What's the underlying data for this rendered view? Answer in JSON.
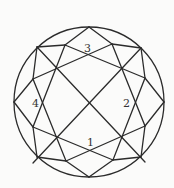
{
  "diagram": {
    "stroke_color": "#2b2b2b",
    "background_color": "#fbfbfa",
    "circle": {
      "cx": 89,
      "cy": 102,
      "r": 75
    },
    "labels": [
      {
        "text": "3",
        "x": 84,
        "y": 52
      },
      {
        "text": "2",
        "x": 123,
        "y": 107
      },
      {
        "text": "4",
        "x": 32,
        "y": 107
      },
      {
        "text": "1",
        "x": 87,
        "y": 146
      }
    ]
  }
}
